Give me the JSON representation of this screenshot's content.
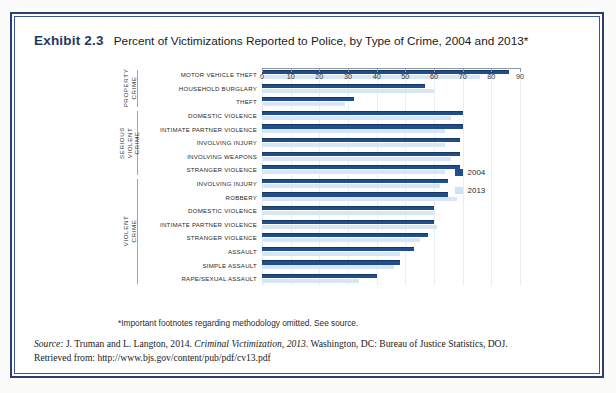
{
  "exhibit": {
    "number": "Exhibit 2.3",
    "title": "Percent of Victimizations Reported to Police, by Type of Crime, 2004 and 2013*"
  },
  "legend": {
    "items": [
      {
        "label": "2004",
        "color": "#1f4e8c"
      },
      {
        "label": "2013",
        "color": "#cfe2f3"
      }
    ]
  },
  "footnote": "*Important footnotes regarding methodology omitted. See source.",
  "source": {
    "label": "Source:",
    "authors": " J. Truman and L. Langton, 2014. ",
    "work": "Criminal Victimization, 2013",
    "publisher": ". Washington, DC: Bureau of Justice Statistics, DOJ.",
    "retrieved": "Retrieved from: http://www.bjs.gov/content/pub/pdf/cv13.pdf"
  },
  "chart_data": {
    "type": "bar",
    "orientation": "horizontal",
    "title": "Percent of Victimizations Reported to Police, by Type of Crime, 2004 and 2013*",
    "xlabel": "",
    "ylabel": "",
    "xlim": [
      0,
      90
    ],
    "xticks": [
      0,
      10,
      20,
      30,
      40,
      50,
      60,
      70,
      80,
      90
    ],
    "grid": false,
    "legend_position": "right",
    "series_names": [
      "2004",
      "2013"
    ],
    "groups": [
      {
        "name": "PROPERTY CRIME",
        "categories": [
          "MOTOR VEHICLE THEFT",
          "HOUSEHOLD BURGLARY",
          "THEFT"
        ],
        "series": [
          {
            "name": "2004",
            "values": [
              86,
              57,
              32
            ]
          },
          {
            "name": "2013",
            "values": [
              76,
              60,
              29
            ]
          }
        ]
      },
      {
        "name": "SERIOUS VIOLENT CRIME",
        "categories": [
          "DOMESTIC VIOLENCE",
          "INTIMATE PARTNER VIOLENCE",
          "INVOLVING INJURY",
          "INVOLVING WEAPONS",
          "STRANGER VIOLENCE"
        ],
        "series": [
          {
            "name": "2004",
            "values": [
              70,
              70,
              69,
              69,
              69
            ]
          },
          {
            "name": "2013",
            "values": [
              66,
              64,
              64,
              66,
              64
            ]
          }
        ]
      },
      {
        "name": "VIOLENT CRIME",
        "categories": [
          "INVOLVING INJURY",
          "ROBBERY",
          "DOMESTIC VIOLENCE",
          "INTIMATE PARTNER VIOLENCE",
          "STRANGER VIOLENCE",
          "ASSAULT",
          "SIMPLE ASSAULT",
          "RAPE/SEXUAL ASSAULT"
        ],
        "series": [
          {
            "name": "2004",
            "values": [
              65,
              65,
              60,
              60,
              58,
              53,
              48,
              40
            ]
          },
          {
            "name": "2013",
            "values": [
              62,
              68,
              60,
              61,
              55,
              48,
              46,
              34
            ]
          }
        ]
      }
    ]
  }
}
